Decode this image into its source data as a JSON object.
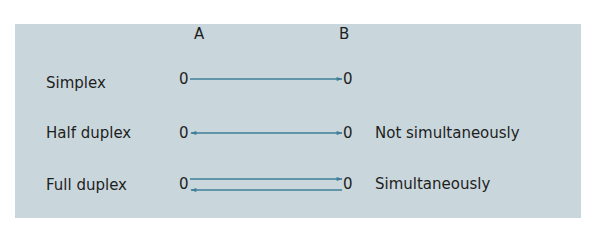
{
  "diagram": {
    "endpoints": {
      "a_label": "A",
      "b_label": "B",
      "node_symbol": "0"
    },
    "rows": [
      {
        "name": "Simplex",
        "note": ""
      },
      {
        "name": "Half duplex",
        "note": "Not simultaneously"
      },
      {
        "name": "Full duplex",
        "note": "Simultaneously"
      }
    ],
    "colors": {
      "panel": "#c9d7dc",
      "arrow": "#3f7e9a",
      "text": "#1e1e1e"
    }
  }
}
